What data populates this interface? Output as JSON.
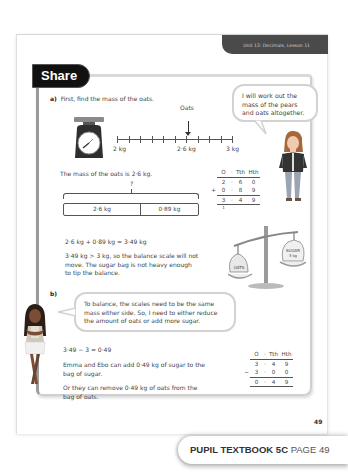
{
  "header": {
    "unit_label": "Unit 12: Decimals, Lesson 11"
  },
  "section": {
    "title": "Share"
  },
  "part_a": {
    "label": "a)",
    "instruction": "First, find the mass of the oats.",
    "number_line": {
      "pointer_label": "Oats",
      "start_label": "2 kg",
      "mid_label": "2·6 kg",
      "end_label": "3 kg",
      "ticks": 11,
      "pointer_value": 2.6
    },
    "mass_statement": "The mass of the oats is 2·6 kg.",
    "bar_model": {
      "total_label": "?",
      "parts": [
        "2·6 kg",
        "0·89 kg"
      ]
    },
    "column_addition": {
      "headers": [
        "O",
        "·",
        "Tth",
        "Hth"
      ],
      "rows": [
        {
          "op": "",
          "digits": [
            "2",
            "·",
            "6",
            "0"
          ]
        },
        {
          "op": "+",
          "digits": [
            "0",
            "·",
            "8",
            "9"
          ]
        },
        {
          "op": "",
          "digits": [
            "3",
            "·",
            "4",
            "9"
          ]
        }
      ],
      "carry": "1"
    },
    "equation": "2·6 kg + 0·89 kg = 3·49 kg",
    "conclusion_lines": [
      "3·49 kg > 3 kg, so the balance scale will not",
      "move. The sugar bag is not heavy enough",
      "to tip the balance."
    ],
    "speech_bubble": [
      "I will work out the",
      "mass of the pears",
      "and oats altogether."
    ],
    "balance": {
      "left_bag_label": "OATS",
      "right_bag_label": "SUGAR",
      "right_bag_mass": "3 kg"
    }
  },
  "part_b": {
    "label": "b)",
    "speech_bubble": [
      "To balance, the scales need to be the same",
      "mass either side. So, I need to either reduce",
      "the amount of oats or add more sugar."
    ],
    "equation": "3·49 − 3 = 0·49",
    "option_1": [
      "Emma and Ebo can add 0·49 kg of sugar to the",
      "bag of sugar."
    ],
    "option_2": [
      "Or they can remove 0·49 kg of oats from the",
      "bag of oats."
    ],
    "column_subtraction": {
      "headers": [
        "O",
        "·",
        "Tth",
        "Hth"
      ],
      "rows": [
        {
          "op": "",
          "digits": [
            "3",
            "·",
            "4",
            "9"
          ]
        },
        {
          "op": "−",
          "digits": [
            "3",
            "·",
            "0",
            "0"
          ]
        },
        {
          "op": "",
          "digits": [
            "0",
            "·",
            "4",
            "9"
          ]
        }
      ]
    }
  },
  "page_number": "49",
  "footer": {
    "book": "PUPIL TEXTBOOK 5C",
    "page": "PAGE 49"
  }
}
